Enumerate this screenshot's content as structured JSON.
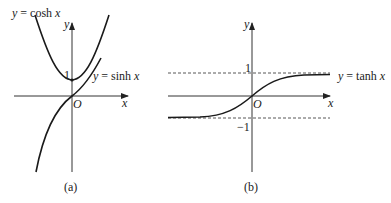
{
  "panels": [
    {
      "id": "a",
      "caption": "(a)",
      "axis_x_label": "x",
      "axis_y_label": "y",
      "origin_label": "O",
      "tick_1_label": "1",
      "curves": [
        {
          "name": "cosh",
          "label": "y = cosh x"
        },
        {
          "name": "sinh",
          "label": "y = sinh x"
        }
      ]
    },
    {
      "id": "b",
      "caption": "(b)",
      "axis_x_label": "x",
      "axis_y_label": "y",
      "origin_label": "O",
      "tick_1_label": "1",
      "tick_neg1_label": "−1",
      "curves": [
        {
          "name": "tanh",
          "label": "y = tanh x"
        }
      ],
      "asymptotes": [
        "y = 1",
        "y = −1"
      ]
    }
  ],
  "colors": {
    "curve": "#1a1a1a",
    "axis": "#333333",
    "text": "#222222"
  }
}
